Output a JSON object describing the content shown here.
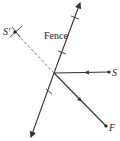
{
  "diagram": {
    "colors": {
      "line": "#333333",
      "dashed": "#777777",
      "background": "#ffffff"
    },
    "labels": {
      "fence": "Fence",
      "s": "S",
      "s_prime": "S′",
      "f": "F"
    },
    "points": {
      "fence_top": [
        80,
        2
      ],
      "fence_bottom": [
        31,
        138
      ],
      "intersection": [
        54,
        73
      ],
      "S": [
        109,
        72
      ],
      "F": [
        106,
        126
      ],
      "S_prime": [
        15,
        32
      ]
    }
  }
}
